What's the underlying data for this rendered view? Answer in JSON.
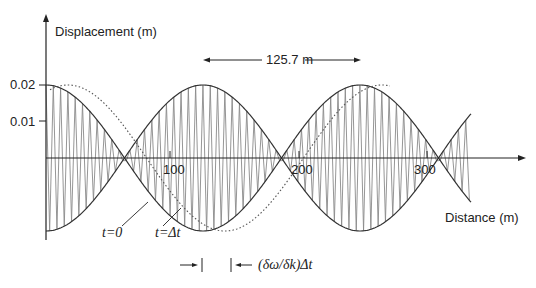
{
  "diagram": {
    "y_axis_label": "Displacement   (m)",
    "x_axis_label": "Distance (m)",
    "y_ticks": [
      {
        "label": "0.02",
        "value": 0.02
      },
      {
        "label": "0.01",
        "value": 0.01
      }
    ],
    "x_ticks": [
      {
        "label": "100",
        "value": 100
      },
      {
        "label": "200",
        "value": 200
      },
      {
        "label": "300",
        "value": 300
      }
    ],
    "wavelength_annotation": "125.7 m",
    "curve_labels": {
      "t0": "t=0",
      "tdt": "t=Δt"
    },
    "group_shift_annotation": "(δω/δk)Δt",
    "colors": {
      "envelope": "#333333",
      "carrier": "#888888",
      "axis": "#222222",
      "dotted": "#555555"
    }
  }
}
